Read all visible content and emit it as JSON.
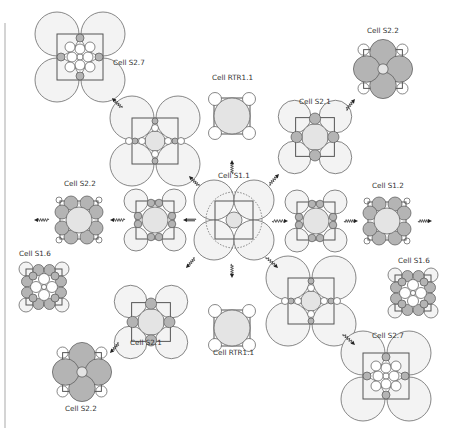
{
  "colors": {
    "background": "#ffffff",
    "border_bar": "#d4d4d4",
    "stroke": "#555555",
    "large_light": "#f3f3f3",
    "core_fill": "#e4e4e4",
    "dark_fill": "#b4b4b4",
    "white": "#ffffff"
  },
  "cells": [
    {
      "id": "s11",
      "label": "Cell S1.1",
      "type": "S1.1",
      "role": "center"
    },
    {
      "id": "rtr-top",
      "label": "Cell RTR1.1",
      "type": "RTR1.1"
    },
    {
      "id": "rtr-bot",
      "label": "Cell RTR1.1",
      "type": "RTR1.1"
    },
    {
      "id": "s21-ur",
      "label": "Cell S2.1",
      "type": "S2.1"
    },
    {
      "id": "s21-ll",
      "label": "Cell S2.1",
      "type": "S2.1"
    },
    {
      "id": "s22-ur",
      "label": "Cell S2.2",
      "type": "S2.2"
    },
    {
      "id": "s22-ll",
      "label": "Cell S2.2",
      "type": "S2.2"
    },
    {
      "id": "s22-l",
      "label": "Cell S2.2",
      "type": "S1.2-like"
    },
    {
      "id": "s12-r",
      "label": "Cell S1.2",
      "type": "S1.2-like"
    },
    {
      "id": "s16-l",
      "label": "Cell S1.6",
      "type": "S1.6"
    },
    {
      "id": "s16-r",
      "label": "Cell S1.6",
      "type": "S1.6"
    },
    {
      "id": "s27-ul",
      "label": "Cell S2.7",
      "type": "S2.7"
    },
    {
      "id": "s27-lr",
      "label": "Cell S2.7",
      "type": "S2.7"
    },
    {
      "id": "inter-ul",
      "label": "",
      "type": "S2.7-intermediate"
    },
    {
      "id": "inter-lr",
      "label": "",
      "type": "S2.7-intermediate"
    },
    {
      "id": "inter-l",
      "label": "",
      "type": "S1.2-intermediate"
    },
    {
      "id": "inter-r",
      "label": "",
      "type": "S1.2-intermediate"
    }
  ],
  "transitions": [
    {
      "from": "s11",
      "to": "rtr-top"
    },
    {
      "from": "s11",
      "to": "rtr-bot"
    },
    {
      "from": "s11",
      "to": "s21-ur"
    },
    {
      "from": "s21-ur",
      "to": "s22-ur"
    },
    {
      "from": "s11",
      "to": "s21-ll"
    },
    {
      "from": "s21-ll",
      "to": "s22-ll"
    },
    {
      "from": "s11",
      "to": "inter-ul"
    },
    {
      "from": "inter-ul",
      "to": "s27-ul"
    },
    {
      "from": "s11",
      "to": "inter-lr"
    },
    {
      "from": "inter-lr",
      "to": "s27-lr"
    },
    {
      "from": "s11",
      "to": "inter-l"
    },
    {
      "from": "inter-l",
      "to": "s22-l"
    },
    {
      "from": "s22-l",
      "to": "off-left"
    },
    {
      "from": "s11",
      "to": "inter-r"
    },
    {
      "from": "inter-r",
      "to": "s12-r"
    },
    {
      "from": "s12-r",
      "to": "off-right"
    }
  ]
}
